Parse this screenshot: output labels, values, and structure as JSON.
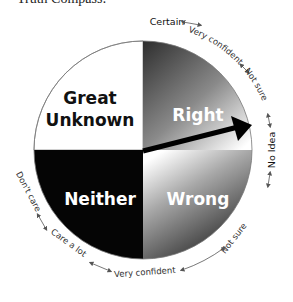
{
  "title": "Truth Compass:",
  "quadrants": {
    "top_left": {
      "label_line1": "Great",
      "label_line2": "Unknown",
      "fill": "#ffffff",
      "text_color": "#111111"
    },
    "top_right": {
      "label": "Right",
      "gradient": [
        "#3a3a3a",
        "#ffffff"
      ],
      "text_color": "#ffffff"
    },
    "bottom_left": {
      "label": "Neither",
      "fill": "#050505",
      "text_color": "#ffffff"
    },
    "bottom_right": {
      "label": "Wrong",
      "gradient": [
        "#ffffff",
        "#1a1a1a"
      ],
      "text_color": "#ffffff"
    }
  },
  "pointer": {
    "color": "#000000",
    "direction": "No Idea"
  },
  "ring_labels": {
    "certain": "Certain",
    "very_confident_top": "Very confident",
    "not_sure_top": "Not sure",
    "no_idea": "No Idea",
    "not_sure_bottom": "Not sure",
    "very_confident_bottom": "Very confident",
    "care_a_lot": "Care a lot",
    "dont_care": "Don't care"
  }
}
